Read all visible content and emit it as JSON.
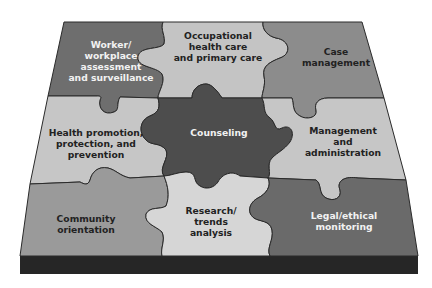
{
  "diagram": {
    "type": "jigsaw-puzzle",
    "colors": {
      "background": "#ffffff",
      "base_edge": "#262626",
      "outline": "#2a2a2a",
      "text_light": "#f2f2f2",
      "text_dark": "#222222"
    },
    "pieces": [
      {
        "id": "worker",
        "row": 0,
        "col": 0,
        "lines": [
          "Worker/",
          "workplace",
          "assessment",
          "and surveillance"
        ],
        "fill": "#6e6e6e",
        "text_tone": "light"
      },
      {
        "id": "occupational",
        "row": 0,
        "col": 1,
        "lines": [
          "Occupational",
          "health care",
          "and primary care"
        ],
        "fill": "#c4c4c4",
        "text_tone": "dark"
      },
      {
        "id": "case",
        "row": 0,
        "col": 2,
        "lines": [
          "Case",
          "management"
        ],
        "fill": "#8c8c8c",
        "text_tone": "dark"
      },
      {
        "id": "health-promotion",
        "row": 1,
        "col": 0,
        "lines": [
          "Health promotion,",
          "protection, and",
          "prevention"
        ],
        "fill": "#c6c6c6",
        "text_tone": "dark"
      },
      {
        "id": "counseling",
        "row": 1,
        "col": 1,
        "lines": [
          "Counseling"
        ],
        "fill": "#4d4d4d",
        "text_tone": "light"
      },
      {
        "id": "management",
        "row": 1,
        "col": 2,
        "lines": [
          "Management",
          "and",
          "administration"
        ],
        "fill": "#c6c6c6",
        "text_tone": "dark"
      },
      {
        "id": "community",
        "row": 2,
        "col": 0,
        "lines": [
          "Community",
          "orientation"
        ],
        "fill": "#9a9a9a",
        "text_tone": "dark"
      },
      {
        "id": "research",
        "row": 2,
        "col": 1,
        "lines": [
          "Research/",
          "trends",
          "analysis"
        ],
        "fill": "#d6d6d6",
        "text_tone": "dark"
      },
      {
        "id": "legal",
        "row": 2,
        "col": 2,
        "lines": [
          "Legal/ethical",
          "monitoring"
        ],
        "fill": "#6a6a6a",
        "text_tone": "light"
      }
    ]
  }
}
